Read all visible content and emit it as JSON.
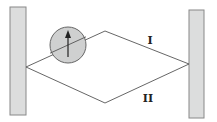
{
  "diagram": {
    "type": "interferometer",
    "plates": {
      "left": {
        "x": 10,
        "y": 7,
        "width": 16,
        "height": 108
      },
      "right": {
        "x": 189,
        "y": 10,
        "width": 15,
        "height": 108
      }
    },
    "source_point": {
      "x": 26,
      "y": 67
    },
    "detector_point": {
      "x": 189,
      "y": 64
    },
    "paths": [
      {
        "id": "I",
        "label": "I",
        "vertex": {
          "x": 105,
          "y": 31
        },
        "label_pos": {
          "x": 150,
          "y": 44
        }
      },
      {
        "id": "II",
        "label": "II",
        "vertex": {
          "x": 105,
          "y": 103
        },
        "label_pos": {
          "x": 148,
          "y": 102
        }
      }
    ],
    "spinner": {
      "cx": 68,
      "cy": 45,
      "r": 18,
      "arrow": {
        "x": 68,
        "y1": 56,
        "y2": 32,
        "direction": "up"
      }
    },
    "colors": {
      "plate_fill": "#dcdddd",
      "plate_stroke": "#888888",
      "line": "#555555",
      "spinner_fill": "#cfd0d0",
      "arrow": "#222222",
      "label": "#222222"
    }
  }
}
